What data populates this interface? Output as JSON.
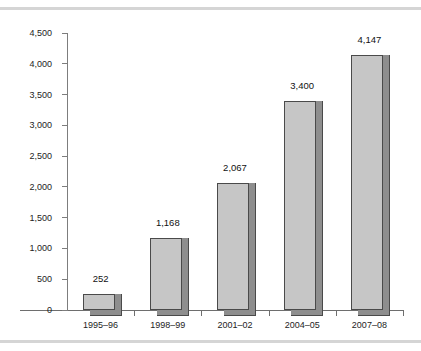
{
  "figure": {
    "width": 421,
    "height": 351,
    "background": "#ffffff",
    "top_rule_color": "#d5d5d5",
    "bottom_rule_color": "#d5d5d5"
  },
  "chart_data": {
    "type": "bar",
    "title": "",
    "subtitle": "",
    "xlabel": "",
    "ylabel": "",
    "categories": [
      "1995–96",
      "1998–99",
      "2001–02",
      "2004–05",
      "2007–08"
    ],
    "values": [
      252,
      1168,
      2067,
      3400,
      4147
    ],
    "value_labels": [
      "252",
      "1,168",
      "2,067",
      "3,400",
      "4,147"
    ],
    "ylim": [
      0,
      4500
    ],
    "ytick_values": [
      0,
      500,
      1000,
      1500,
      2000,
      2500,
      3000,
      3500,
      4000,
      4500
    ],
    "ytick_labels": [
      "0",
      "500",
      "1,000",
      "1,500",
      "2,000",
      "2,500",
      "3,000",
      "3,500",
      "4,000",
      "4,500"
    ],
    "grid": false,
    "legend": null,
    "legend_position": "none",
    "series": [
      {
        "name": "series-1",
        "values": [
          252,
          1168,
          2067,
          3400,
          4147
        ],
        "bar_face_color": "#c6c6c6",
        "bar_shadow_color": "#8e8e8e",
        "bar_outline_color": "#4a4a4a"
      }
    ],
    "axis_color": "#6e6e6e",
    "annotations": []
  }
}
